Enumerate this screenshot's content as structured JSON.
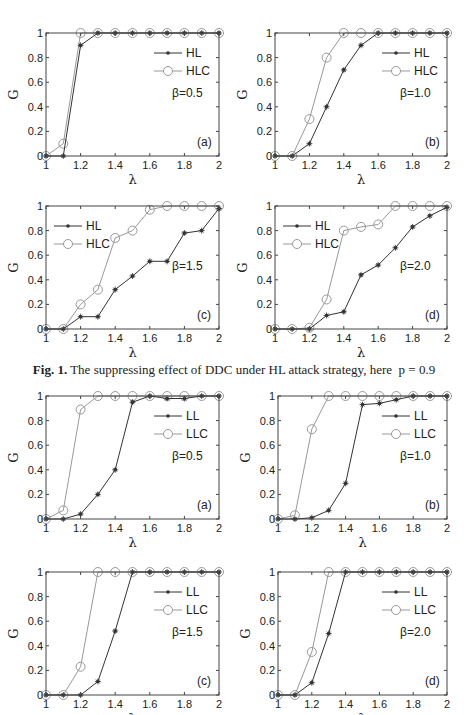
{
  "figure1": {
    "caption_label": "Fig. 1.",
    "caption_text": "The suppressing effect of DDC under HL attack strategy, here",
    "caption_param": "p = 0.9"
  },
  "chart_data": [
    {
      "id": "fig1a",
      "type": "line",
      "panel_label": "(a)",
      "annotation": "β=0.5",
      "xlabel": "λ",
      "ylabel": "G",
      "x": [
        1.0,
        1.1,
        1.2,
        1.3,
        1.4,
        1.5,
        1.6,
        1.7,
        1.8,
        1.9,
        2.0
      ],
      "xlim": [
        1,
        2
      ],
      "ylim": [
        0,
        1
      ],
      "xticks": [
        "1",
        "1.2",
        "1.4",
        "1.6",
        "1.8",
        "2"
      ],
      "yticks": [
        "0",
        "0.2",
        "0.4",
        "0.6",
        "0.8",
        "1"
      ],
      "legend_position": "upper right",
      "series": [
        {
          "name": "HL",
          "marker": "star",
          "values": [
            0,
            0,
            0.9,
            1,
            1,
            1,
            1,
            1,
            1,
            1,
            1
          ]
        },
        {
          "name": "HLC",
          "marker": "circle",
          "values": [
            0,
            0.1,
            1,
            1,
            1,
            1,
            1,
            1,
            1,
            1,
            1
          ]
        }
      ]
    },
    {
      "id": "fig1b",
      "type": "line",
      "panel_label": "(b)",
      "annotation": "β=1.0",
      "xlabel": "λ",
      "ylabel": "G",
      "x": [
        1.0,
        1.1,
        1.2,
        1.3,
        1.4,
        1.5,
        1.6,
        1.7,
        1.8,
        1.9,
        2.0
      ],
      "xlim": [
        1,
        2
      ],
      "ylim": [
        0,
        1
      ],
      "xticks": [
        "1",
        "1.2",
        "1.4",
        "1.6",
        "1.8",
        "2"
      ],
      "yticks": [
        "0",
        "0.2",
        "0.4",
        "0.6",
        "0.8",
        "1"
      ],
      "legend_position": "upper right",
      "series": [
        {
          "name": "HL",
          "marker": "star",
          "values": [
            0,
            0,
            0.1,
            0.4,
            0.7,
            0.9,
            1,
            1,
            1,
            1,
            1
          ]
        },
        {
          "name": "HLC",
          "marker": "circle",
          "values": [
            0,
            0,
            0.3,
            0.8,
            1,
            1,
            1,
            1,
            1,
            1,
            1
          ]
        }
      ]
    },
    {
      "id": "fig1c",
      "type": "line",
      "panel_label": "(c)",
      "annotation": "β=1.5",
      "xlabel": "λ",
      "ylabel": "G",
      "x": [
        1.0,
        1.1,
        1.2,
        1.3,
        1.4,
        1.5,
        1.6,
        1.7,
        1.8,
        1.9,
        2.0
      ],
      "xlim": [
        1,
        2
      ],
      "ylim": [
        0,
        1
      ],
      "xticks": [
        "1",
        "1.2",
        "1.4",
        "1.6",
        "1.8",
        "2"
      ],
      "yticks": [
        "0",
        "0.2",
        "0.4",
        "0.6",
        "0.8",
        "1"
      ],
      "legend_position": "upper left",
      "series": [
        {
          "name": "HL",
          "marker": "star",
          "values": [
            0,
            0,
            0.1,
            0.1,
            0.32,
            0.43,
            0.55,
            0.55,
            0.78,
            0.8,
            0.98
          ]
        },
        {
          "name": "HLC",
          "marker": "circle",
          "values": [
            0,
            0,
            0.2,
            0.32,
            0.74,
            0.8,
            0.97,
            1,
            1,
            1,
            1
          ]
        }
      ]
    },
    {
      "id": "fig1d",
      "type": "line",
      "panel_label": "(d)",
      "annotation": "β=2.0",
      "xlabel": "λ",
      "ylabel": "G",
      "x": [
        1.0,
        1.1,
        1.2,
        1.3,
        1.4,
        1.5,
        1.6,
        1.7,
        1.8,
        1.9,
        2.0
      ],
      "xlim": [
        1,
        2
      ],
      "ylim": [
        0,
        1
      ],
      "xticks": [
        "1",
        "1.2",
        "1.4",
        "1.6",
        "1.8",
        "2"
      ],
      "yticks": [
        "0",
        "0.2",
        "0.4",
        "0.6",
        "0.8",
        "1"
      ],
      "legend_position": "upper left",
      "series": [
        {
          "name": "HL",
          "marker": "star",
          "values": [
            0,
            0,
            0,
            0.11,
            0.14,
            0.44,
            0.52,
            0.66,
            0.83,
            0.92,
            0.99
          ]
        },
        {
          "name": "HLC",
          "marker": "circle",
          "values": [
            0,
            0,
            0.01,
            0.24,
            0.8,
            0.83,
            0.85,
            1,
            1,
            1,
            1
          ]
        }
      ]
    },
    {
      "id": "fig2a",
      "type": "line",
      "panel_label": "(a)",
      "annotation": "β=0.5",
      "xlabel": "λ",
      "ylabel": "G",
      "x": [
        1.0,
        1.1,
        1.2,
        1.3,
        1.4,
        1.5,
        1.6,
        1.7,
        1.8,
        1.9,
        2.0
      ],
      "xlim": [
        1,
        2
      ],
      "ylim": [
        0,
        1
      ],
      "xticks": [
        "1",
        "1.2",
        "1.4",
        "1.6",
        "1.8",
        "2"
      ],
      "yticks": [
        "0",
        "0.2",
        "0.4",
        "0.6",
        "0.8",
        "1"
      ],
      "legend_position": "upper right",
      "series": [
        {
          "name": "LL",
          "marker": "star",
          "values": [
            0,
            0,
            0.04,
            0.2,
            0.4,
            0.95,
            1,
            0.98,
            0.98,
            1,
            1
          ]
        },
        {
          "name": "LLC",
          "marker": "circle",
          "values": [
            0,
            0.07,
            0.89,
            1,
            1,
            1,
            1,
            1,
            1,
            1,
            1
          ]
        }
      ]
    },
    {
      "id": "fig2b",
      "type": "line",
      "panel_label": "(b)",
      "annotation": "β=1.0",
      "xlabel": "λ",
      "ylabel": "G",
      "x": [
        1.0,
        1.1,
        1.2,
        1.3,
        1.4,
        1.5,
        1.6,
        1.7,
        1.8,
        1.9,
        2.0
      ],
      "xlim": [
        1,
        2
      ],
      "ylim": [
        0,
        1
      ],
      "xticks": [
        "1",
        "1.2",
        "1.4",
        "1.6",
        "1.8",
        "2"
      ],
      "yticks": [
        "0",
        "0.2",
        "0.4",
        "0.6",
        "0.8",
        "1"
      ],
      "legend_position": "upper right",
      "series": [
        {
          "name": "LL",
          "marker": "star",
          "values": [
            0,
            0,
            0.01,
            0.07,
            0.29,
            0.93,
            0.94,
            0.97,
            1,
            1,
            1
          ]
        },
        {
          "name": "LLC",
          "marker": "circle",
          "values": [
            0,
            0.03,
            0.73,
            1,
            1,
            1,
            1,
            1,
            1,
            1,
            1
          ]
        }
      ]
    },
    {
      "id": "fig2c",
      "type": "line",
      "panel_label": "(c)",
      "annotation": "β=1.5",
      "xlabel": "λ",
      "ylabel": "G",
      "x": [
        1.0,
        1.1,
        1.2,
        1.3,
        1.4,
        1.5,
        1.6,
        1.7,
        1.8,
        1.9,
        2.0
      ],
      "xlim": [
        1,
        2
      ],
      "ylim": [
        0,
        1
      ],
      "xticks": [
        "1",
        "1.2",
        "1.4",
        "1.6",
        "1.8",
        "2"
      ],
      "yticks": [
        "0",
        "0.2",
        "0.4",
        "0.6",
        "0.8",
        "1"
      ],
      "legend_position": "upper right",
      "series": [
        {
          "name": "LL",
          "marker": "star",
          "values": [
            0,
            0,
            0,
            0.11,
            0.52,
            1,
            1,
            1,
            1,
            1,
            1
          ]
        },
        {
          "name": "LLC",
          "marker": "circle",
          "values": [
            0,
            0,
            0.23,
            1,
            1,
            1,
            1,
            1,
            1,
            1,
            1
          ]
        }
      ]
    },
    {
      "id": "fig2d",
      "type": "line",
      "panel_label": "(d)",
      "annotation": "β=2.0",
      "xlabel": "λ",
      "ylabel": "G",
      "x": [
        1.0,
        1.1,
        1.2,
        1.3,
        1.4,
        1.5,
        1.6,
        1.7,
        1.8,
        1.9,
        2.0
      ],
      "xlim": [
        1,
        2
      ],
      "ylim": [
        0,
        1
      ],
      "xticks": [
        "1",
        "1.2",
        "1.4",
        "1.6",
        "1.8",
        "2"
      ],
      "yticks": [
        "0",
        "0.2",
        "0.4",
        "0.6",
        "0.8",
        "1"
      ],
      "legend_position": "upper right",
      "series": [
        {
          "name": "LL",
          "marker": "star",
          "values": [
            0,
            0,
            0.1,
            0.5,
            1,
            1,
            1,
            1,
            1,
            1,
            1
          ]
        },
        {
          "name": "LLC",
          "marker": "circle",
          "values": [
            0,
            0,
            0.35,
            1,
            1,
            1,
            1,
            1,
            1,
            1,
            1
          ]
        }
      ]
    }
  ],
  "layout": {
    "panels": [
      {
        "left": 46,
        "top": 33,
        "width": 173,
        "height": 123
      },
      {
        "left": 275,
        "top": 33,
        "width": 172,
        "height": 123
      },
      {
        "left": 46,
        "top": 206,
        "width": 173,
        "height": 123
      },
      {
        "left": 275,
        "top": 206,
        "width": 172,
        "height": 123
      },
      {
        "left": 46,
        "top": 396,
        "width": 173,
        "height": 123
      },
      {
        "left": 278,
        "top": 396,
        "width": 169,
        "height": 123
      },
      {
        "left": 46,
        "top": 572,
        "width": 173,
        "height": 123
      },
      {
        "left": 278,
        "top": 572,
        "width": 169,
        "height": 123
      }
    ],
    "colors": {
      "star_series": "#333333",
      "circle_series": "#999999",
      "axis": "#444444"
    }
  }
}
